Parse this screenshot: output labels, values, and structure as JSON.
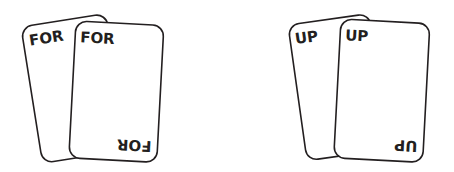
{
  "colors": {
    "background": "#ffffff",
    "card_stroke": "#231f20",
    "card_fill": "#ffffff",
    "text": "#231f20"
  },
  "groups": [
    {
      "name": "for-cards",
      "back_card": {
        "label": "FOR"
      },
      "front_card": {
        "label_top": "FOR",
        "label_bottom": "FOR"
      }
    },
    {
      "name": "up-cards",
      "back_card": {
        "label": "UP"
      },
      "front_card": {
        "label_top": "UP",
        "label_bottom": "UP"
      }
    }
  ]
}
